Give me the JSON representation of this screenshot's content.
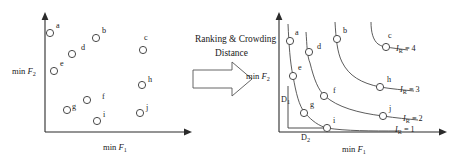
{
  "figure": {
    "transform_caption_line1": "Ranking & Crowding",
    "transform_caption_line2": "Distance",
    "arrow_icon": "block-right-arrow-icon",
    "colors": {
      "axis": "#2b2b2b",
      "marker_stroke": "#4a4a4a",
      "marker_fill": "#ffffff",
      "curve": "#4a4a4a",
      "text": "#1a1a1a",
      "background": "#ffffff"
    }
  },
  "left_plot": {
    "name": "unsorted-population-scatter",
    "xlabel_prefix": "min ",
    "xlabel_symbol": "F",
    "xlabel_sub": "1",
    "ylabel_prefix": "min ",
    "ylabel_symbol": "F",
    "ylabel_sub": "2",
    "axis": {
      "x0": 45,
      "y0": 132,
      "x_end": 192,
      "y_top": 14
    },
    "points": [
      {
        "label": "a",
        "cx": 50,
        "cy": 33,
        "lx": 56,
        "ly": 28
      },
      {
        "label": "b",
        "cx": 96,
        "cy": 38,
        "lx": 102,
        "ly": 33
      },
      {
        "label": "c",
        "cx": 143,
        "cy": 50,
        "lx": 144,
        "ly": 38
      },
      {
        "label": "d",
        "cx": 72,
        "cy": 54,
        "lx": 81,
        "ly": 49
      },
      {
        "label": "e",
        "cx": 54,
        "cy": 71,
        "lx": 60,
        "ly": 65
      },
      {
        "label": "f",
        "cx": 87,
        "cy": 100,
        "lx": 102,
        "ly": 99
      },
      {
        "label": "g",
        "cx": 67,
        "cy": 110,
        "lx": 72,
        "ly": 109
      },
      {
        "label": "h",
        "cx": 142,
        "cy": 85,
        "lx": 148,
        "ly": 81
      },
      {
        "label": "i",
        "cx": 97,
        "cy": 121,
        "lx": 103,
        "ly": 116
      },
      {
        "label": "j",
        "cx": 140,
        "cy": 113,
        "lx": 146,
        "ly": 109
      }
    ]
  },
  "right_plot": {
    "name": "ranked-fronts-plot",
    "xlabel_prefix": "min ",
    "xlabel_symbol": "F",
    "xlabel_sub": "1",
    "ylabel_prefix": "min ",
    "ylabel_symbol": "F",
    "ylabel_sub": "2",
    "axis": {
      "x0": 279,
      "y0": 132,
      "x_end": 447,
      "y_top": 12
    },
    "points": [
      {
        "label": "a",
        "cx": 290,
        "cy": 41,
        "lx": 295,
        "ly": 34
      },
      {
        "label": "e",
        "cx": 293,
        "cy": 76,
        "lx": 298,
        "ly": 69
      },
      {
        "label": "g",
        "cx": 304,
        "cy": 113,
        "lx": 310,
        "ly": 106
      },
      {
        "label": "i",
        "cx": 327,
        "cy": 128,
        "lx": 333,
        "ly": 122
      },
      {
        "label": "d",
        "cx": 309,
        "cy": 52,
        "lx": 317,
        "ly": 48
      },
      {
        "label": "f",
        "cx": 324,
        "cy": 96,
        "lx": 333,
        "ly": 92
      },
      {
        "label": "j",
        "cx": 383,
        "cy": 116,
        "lx": 389,
        "ly": 110
      },
      {
        "label": "b",
        "cx": 337,
        "cy": 39,
        "lx": 343,
        "ly": 32
      },
      {
        "label": "h",
        "cx": 380,
        "cy": 87,
        "lx": 387,
        "ly": 81
      },
      {
        "label": "c",
        "cx": 386,
        "cy": 47,
        "lx": 388,
        "ly": 36
      }
    ],
    "fronts": [
      {
        "rank": 1,
        "label_prefix": "I",
        "label_sub": "R",
        "label_eq": " = 1",
        "lx": 395,
        "ly": 131
      },
      {
        "rank": 2,
        "label_prefix": "I",
        "label_sub": "R",
        "label_eq": " = 2",
        "lx": 403,
        "ly": 121
      },
      {
        "rank": 3,
        "label_prefix": "I",
        "label_sub": "R",
        "label_eq": " = 3",
        "lx": 400,
        "ly": 92
      },
      {
        "rank": 4,
        "label_prefix": "I",
        "label_sub": "R",
        "label_eq": " = 4",
        "lx": 396,
        "ly": 51
      }
    ],
    "distances": [
      {
        "label": "D",
        "sub": "1",
        "lx": 282,
        "ly": 101,
        "name": "crowding-distance-d1"
      },
      {
        "label": "D",
        "sub": "2",
        "lx": 305,
        "ly": 138,
        "name": "crowding-distance-d2"
      }
    ]
  }
}
